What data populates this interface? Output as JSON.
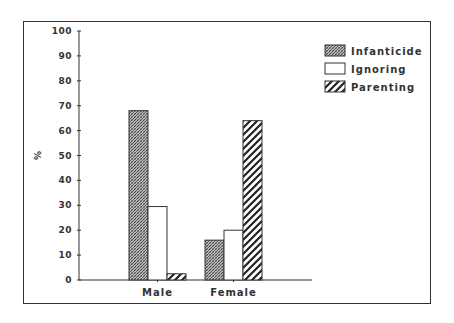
{
  "chart_data": {
    "type": "bar",
    "title": "",
    "xlabel": "",
    "ylabel": "%",
    "ylim": [
      0,
      100
    ],
    "yticks": [
      0,
      10,
      20,
      30,
      40,
      50,
      60,
      70,
      80,
      90,
      100
    ],
    "grid": false,
    "legend_position": "upper right",
    "categories": [
      "Male",
      "Female"
    ],
    "series": [
      {
        "name": "Infanticide",
        "pattern": "dense-crosshatch",
        "values": [
          68,
          16
        ]
      },
      {
        "name": "Ignoring",
        "pattern": "white",
        "values": [
          29.5,
          20
        ]
      },
      {
        "name": "Parenting",
        "pattern": "diagonal-stripes",
        "values": [
          2.5,
          64
        ]
      }
    ]
  },
  "colors": {
    "ink": "#333333",
    "background": "#ffffff"
  }
}
